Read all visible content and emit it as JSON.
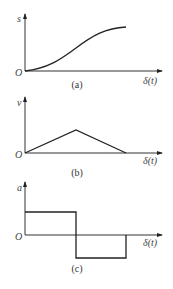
{
  "figure": {
    "panels": [
      {
        "id": "a",
        "caption": "(a)",
        "y_label": "s",
        "x_label": "δ(t)",
        "origin_label": "O",
        "description": "displacement: smooth S-shaped curve rising from origin and leveling off"
      },
      {
        "id": "b",
        "caption": "(b)",
        "y_label": "v",
        "x_label": "δ(t)",
        "origin_label": "O",
        "description": "velocity: triangular profile, linear rise to peak at midpoint then linear fall to zero"
      },
      {
        "id": "c",
        "caption": "(c)",
        "y_label": "a",
        "x_label": "δ(t)",
        "origin_label": "O",
        "description": "acceleration: constant positive first half, constant negative second half"
      }
    ]
  }
}
